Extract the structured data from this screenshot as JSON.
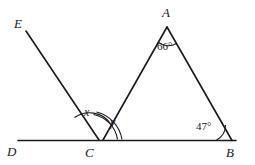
{
  "figure": {
    "type": "geometry-diagram",
    "stroke_color": "#1a1a1a",
    "background_color": "#ffffff"
  },
  "points": [
    {
      "name": "E",
      "label": "E",
      "x": 20,
      "y": 24
    },
    {
      "name": "A",
      "label": "A",
      "x": 167,
      "y": 14
    },
    {
      "name": "D",
      "label": "D",
      "x": 11,
      "y": 152
    },
    {
      "name": "C",
      "label": "C",
      "x": 89,
      "y": 153
    },
    {
      "name": "B",
      "label": "B",
      "x": 230,
      "y": 153
    }
  ],
  "angles": [
    {
      "name": "angle-x",
      "label": "x",
      "x": 86,
      "y": 112,
      "vertex": "C",
      "kind": "variable"
    },
    {
      "name": "angle-y",
      "label": "y",
      "x": 111,
      "y": 122,
      "vertex": "C",
      "kind": "variable"
    },
    {
      "name": "angle-a",
      "label": "66°",
      "x": 159,
      "y": 42,
      "vertex": "A",
      "kind": "measure"
    },
    {
      "name": "angle-b",
      "label": "47°",
      "x": 198,
      "y": 122,
      "vertex": "B",
      "kind": "measure"
    }
  ],
  "segments": [
    {
      "name": "line-DB",
      "from": "D",
      "to": "B"
    },
    {
      "name": "ray-EC",
      "from": "E",
      "to": "C"
    },
    {
      "name": "side-CA",
      "from": "C",
      "to": "A"
    },
    {
      "name": "side-AB",
      "from": "A",
      "to": "B"
    }
  ]
}
